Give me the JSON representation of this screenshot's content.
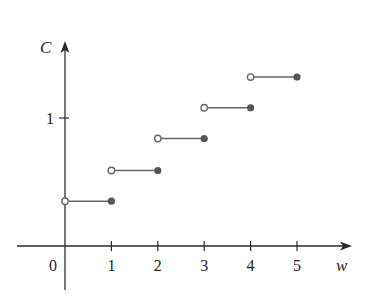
{
  "chart_data": {
    "type": "line",
    "subtype": "step",
    "title": "",
    "xlabel": "w",
    "ylabel": "C",
    "x_ticks": [
      "1",
      "2",
      "3",
      "4",
      "5"
    ],
    "y_ticks": [
      "1"
    ],
    "origin_label": "0",
    "xlim": [
      0,
      5
    ],
    "ylim": [
      0,
      1.4
    ],
    "grid": false,
    "legend": null,
    "steps": [
      {
        "x_start": 0,
        "x_end": 1,
        "y": 0.35,
        "start": "open",
        "end": "closed"
      },
      {
        "x_start": 1,
        "x_end": 2,
        "y": 0.59,
        "start": "open",
        "end": "closed"
      },
      {
        "x_start": 2,
        "x_end": 3,
        "y": 0.84,
        "start": "open",
        "end": "closed"
      },
      {
        "x_start": 3,
        "x_end": 4,
        "y": 1.08,
        "start": "open",
        "end": "closed"
      },
      {
        "x_start": 4,
        "x_end": 5,
        "y": 1.32,
        "start": "open",
        "end": "closed"
      }
    ],
    "colors": {
      "axis": "#2a2a2a",
      "segment": "#666666",
      "closed_dot": "#555555",
      "open_dot_fill": "#ffffff"
    }
  }
}
